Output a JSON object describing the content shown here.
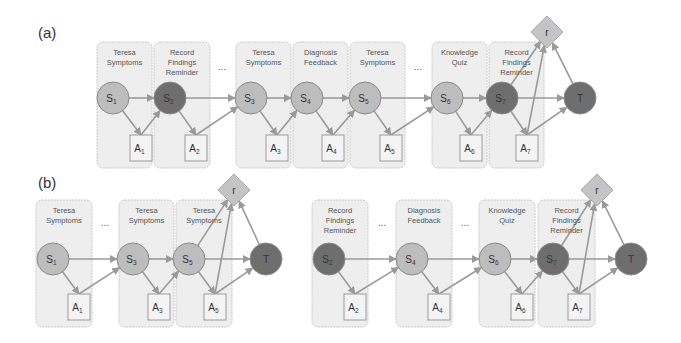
{
  "colors": {
    "column_fill": "#eeeeee",
    "column_stroke": "#c8c8c8",
    "state_light": "#bdbdbd",
    "state_dark": "#6e6e6e",
    "state_stroke": "#8a8a8a",
    "action_fill": "#f4f4f4",
    "action_stroke": "#9a9a9a",
    "reward_fill": "#c4c4c4",
    "edge": "#9a9a9a"
  },
  "panels": [
    {
      "label": "(a)",
      "label_pos": [
        38,
        38
      ],
      "columns": [
        {
          "x": 97,
          "y": 42,
          "w": 55,
          "h": 126,
          "title": [
            "Teresa",
            "Symptoms"
          ]
        },
        {
          "x": 154,
          "y": 42,
          "w": 56,
          "h": 126,
          "title": [
            "Record",
            "Findings",
            "Reminder"
          ]
        },
        {
          "x": 236,
          "y": 42,
          "w": 55,
          "h": 126,
          "title": [
            "Teresa",
            "Symptoms"
          ]
        },
        {
          "x": 293,
          "y": 42,
          "w": 55,
          "h": 126,
          "title": [
            "Diagnosis",
            "Feedback"
          ]
        },
        {
          "x": 350,
          "y": 42,
          "w": 55,
          "h": 126,
          "title": [
            "Teresa",
            "Symptoms"
          ]
        },
        {
          "x": 432,
          "y": 42,
          "w": 55,
          "h": 126,
          "title": [
            "Knowledge",
            "Quiz"
          ]
        },
        {
          "x": 489,
          "y": 42,
          "w": 55,
          "h": 126,
          "title": [
            "Record",
            "Findings",
            "Reminder"
          ]
        }
      ],
      "ellipses": [
        {
          "x": 222,
          "y": 70,
          "text": "..."
        },
        {
          "x": 418,
          "y": 70,
          "text": "..."
        }
      ],
      "states": [
        {
          "id": "S1",
          "base": "S",
          "sub": "1",
          "cx": 113,
          "cy": 98,
          "dark": false
        },
        {
          "id": "S2",
          "base": "S",
          "sub": "2",
          "cx": 170,
          "cy": 98,
          "dark": true
        },
        {
          "id": "S3",
          "base": "S",
          "sub": "3",
          "cx": 251,
          "cy": 98,
          "dark": false
        },
        {
          "id": "S4",
          "base": "S",
          "sub": "4",
          "cx": 307,
          "cy": 98,
          "dark": false
        },
        {
          "id": "S5",
          "base": "S",
          "sub": "5",
          "cx": 365,
          "cy": 98,
          "dark": false
        },
        {
          "id": "S6",
          "base": "S",
          "sub": "6",
          "cx": 447,
          "cy": 98,
          "dark": false
        },
        {
          "id": "S7",
          "base": "S",
          "sub": "7",
          "cx": 502,
          "cy": 98,
          "dark": true
        },
        {
          "id": "T",
          "base": "T",
          "sub": "",
          "cx": 580,
          "cy": 98,
          "dark": true
        }
      ],
      "actions": [
        {
          "id": "A1",
          "base": "A",
          "sub": "1",
          "x": 130,
          "y": 135,
          "w": 22,
          "h": 26
        },
        {
          "id": "A2",
          "base": "A",
          "sub": "2",
          "x": 185,
          "y": 135,
          "w": 22,
          "h": 26
        },
        {
          "id": "A3",
          "base": "A",
          "sub": "3",
          "x": 266,
          "y": 135,
          "w": 22,
          "h": 26
        },
        {
          "id": "A4",
          "base": "A",
          "sub": "4",
          "x": 322,
          "y": 135,
          "w": 22,
          "h": 26
        },
        {
          "id": "A5",
          "base": "A",
          "sub": "5",
          "x": 380,
          "y": 135,
          "w": 22,
          "h": 26
        },
        {
          "id": "A6",
          "base": "A",
          "sub": "6",
          "x": 460,
          "y": 135,
          "w": 22,
          "h": 26
        },
        {
          "id": "A7",
          "base": "A",
          "sub": "7",
          "x": 516,
          "y": 135,
          "w": 22,
          "h": 26
        }
      ],
      "reward": {
        "label": "r",
        "cx": 547,
        "cy": 32,
        "size": 16
      },
      "edges": [
        [
          "S1",
          "S2"
        ],
        [
          "S2",
          "S3"
        ],
        [
          "S3",
          "S4"
        ],
        [
          "S4",
          "S5"
        ],
        [
          "S5",
          "S6"
        ],
        [
          "S6",
          "S7"
        ],
        [
          "S7",
          "T"
        ],
        [
          "S1",
          "A1"
        ],
        [
          "A1",
          "S2"
        ],
        [
          "S2",
          "A2"
        ],
        [
          "A2",
          "S3"
        ],
        [
          "S3",
          "A3"
        ],
        [
          "A3",
          "S4"
        ],
        [
          "S4",
          "A4"
        ],
        [
          "A4",
          "S5"
        ],
        [
          "S5",
          "A5"
        ],
        [
          "A5",
          "S6"
        ],
        [
          "S6",
          "A6"
        ],
        [
          "A6",
          "S7"
        ],
        [
          "S7",
          "A7"
        ],
        [
          "A7",
          "T"
        ],
        [
          "S7",
          "r"
        ],
        [
          "A7",
          "r"
        ],
        [
          "T",
          "r"
        ]
      ]
    },
    {
      "label": "(b)",
      "label_pos": [
        38,
        188
      ],
      "columns": [
        {
          "x": 36,
          "y": 200,
          "w": 56,
          "h": 127,
          "title": [
            "Teresa",
            "Symptoms"
          ]
        },
        {
          "x": 119,
          "y": 200,
          "w": 55,
          "h": 127,
          "title": [
            "Teresa",
            "Symptoms"
          ]
        },
        {
          "x": 176,
          "y": 200,
          "w": 56,
          "h": 127,
          "title": [
            "Teresa",
            "Symptoms"
          ]
        }
      ],
      "ellipses": [
        {
          "x": 105,
          "y": 226,
          "text": "..."
        }
      ],
      "states": [
        {
          "id": "S1",
          "base": "S",
          "sub": "1",
          "cx": 53,
          "cy": 259,
          "dark": false
        },
        {
          "id": "S3",
          "base": "S",
          "sub": "3",
          "cx": 133,
          "cy": 259,
          "dark": false
        },
        {
          "id": "S5",
          "base": "S",
          "sub": "5",
          "cx": 189,
          "cy": 259,
          "dark": false
        },
        {
          "id": "T",
          "base": "T",
          "sub": "",
          "cx": 266,
          "cy": 259,
          "dark": true
        }
      ],
      "actions": [
        {
          "id": "A1",
          "base": "A",
          "sub": "1",
          "x": 68,
          "y": 294,
          "w": 22,
          "h": 26
        },
        {
          "id": "A3",
          "base": "A",
          "sub": "3",
          "x": 148,
          "y": 294,
          "w": 22,
          "h": 26
        },
        {
          "id": "A5",
          "base": "A",
          "sub": "5",
          "x": 204,
          "y": 294,
          "w": 22,
          "h": 26
        }
      ],
      "reward": {
        "label": "r",
        "cx": 234,
        "cy": 190,
        "size": 16
      },
      "edges": [
        [
          "S1",
          "S3"
        ],
        [
          "S3",
          "S5"
        ],
        [
          "S5",
          "T"
        ],
        [
          "S1",
          "A1"
        ],
        [
          "A1",
          "S3"
        ],
        [
          "S3",
          "A3"
        ],
        [
          "A3",
          "S5"
        ],
        [
          "S5",
          "A5"
        ],
        [
          "A5",
          "T"
        ],
        [
          "S5",
          "r"
        ],
        [
          "A5",
          "r"
        ],
        [
          "T",
          "r"
        ]
      ]
    },
    {
      "label": "",
      "label_pos": [
        0,
        0
      ],
      "columns": [
        {
          "x": 312,
          "y": 200,
          "w": 56,
          "h": 127,
          "title": [
            "Record",
            "Findings",
            "Reminder"
          ]
        },
        {
          "x": 396,
          "y": 200,
          "w": 56,
          "h": 127,
          "title": [
            "Diagnosis",
            "Feedback"
          ]
        },
        {
          "x": 479,
          "y": 200,
          "w": 56,
          "h": 127,
          "title": [
            "Knowledge",
            "Quiz"
          ]
        },
        {
          "x": 538,
          "y": 200,
          "w": 57,
          "h": 127,
          "title": [
            "Record",
            "Findings",
            "Reminder"
          ]
        }
      ],
      "ellipses": [
        {
          "x": 382,
          "y": 226,
          "text": "..."
        },
        {
          "x": 465,
          "y": 226,
          "text": "..."
        }
      ],
      "states": [
        {
          "id": "S2",
          "base": "S",
          "sub": "2",
          "cx": 329,
          "cy": 259,
          "dark": true
        },
        {
          "id": "S4",
          "base": "S",
          "sub": "4",
          "cx": 412,
          "cy": 259,
          "dark": false
        },
        {
          "id": "S6",
          "base": "S",
          "sub": "6",
          "cx": 495,
          "cy": 259,
          "dark": false
        },
        {
          "id": "S7",
          "base": "S",
          "sub": "7",
          "cx": 553,
          "cy": 259,
          "dark": true
        },
        {
          "id": "T",
          "base": "T",
          "sub": "",
          "cx": 631,
          "cy": 259,
          "dark": true
        }
      ],
      "actions": [
        {
          "id": "A2",
          "base": "A",
          "sub": "2",
          "x": 344,
          "y": 294,
          "w": 22,
          "h": 26
        },
        {
          "id": "A4",
          "base": "A",
          "sub": "4",
          "x": 428,
          "y": 294,
          "w": 22,
          "h": 26
        },
        {
          "id": "A6",
          "base": "A",
          "sub": "6",
          "x": 511,
          "y": 294,
          "w": 22,
          "h": 26
        },
        {
          "id": "A7",
          "base": "A",
          "sub": "7",
          "x": 568,
          "y": 294,
          "w": 22,
          "h": 26
        }
      ],
      "reward": {
        "label": "r",
        "cx": 597,
        "cy": 190,
        "size": 16
      },
      "edges": [
        [
          "S2",
          "S4"
        ],
        [
          "S4",
          "S6"
        ],
        [
          "S6",
          "S7"
        ],
        [
          "S7",
          "T"
        ],
        [
          "S2",
          "A2"
        ],
        [
          "A2",
          "S4"
        ],
        [
          "S4",
          "A4"
        ],
        [
          "A4",
          "S6"
        ],
        [
          "S6",
          "A6"
        ],
        [
          "A6",
          "S7"
        ],
        [
          "S7",
          "A7"
        ],
        [
          "A7",
          "T"
        ],
        [
          "S7",
          "r"
        ],
        [
          "A7",
          "r"
        ],
        [
          "T",
          "r"
        ]
      ]
    }
  ]
}
